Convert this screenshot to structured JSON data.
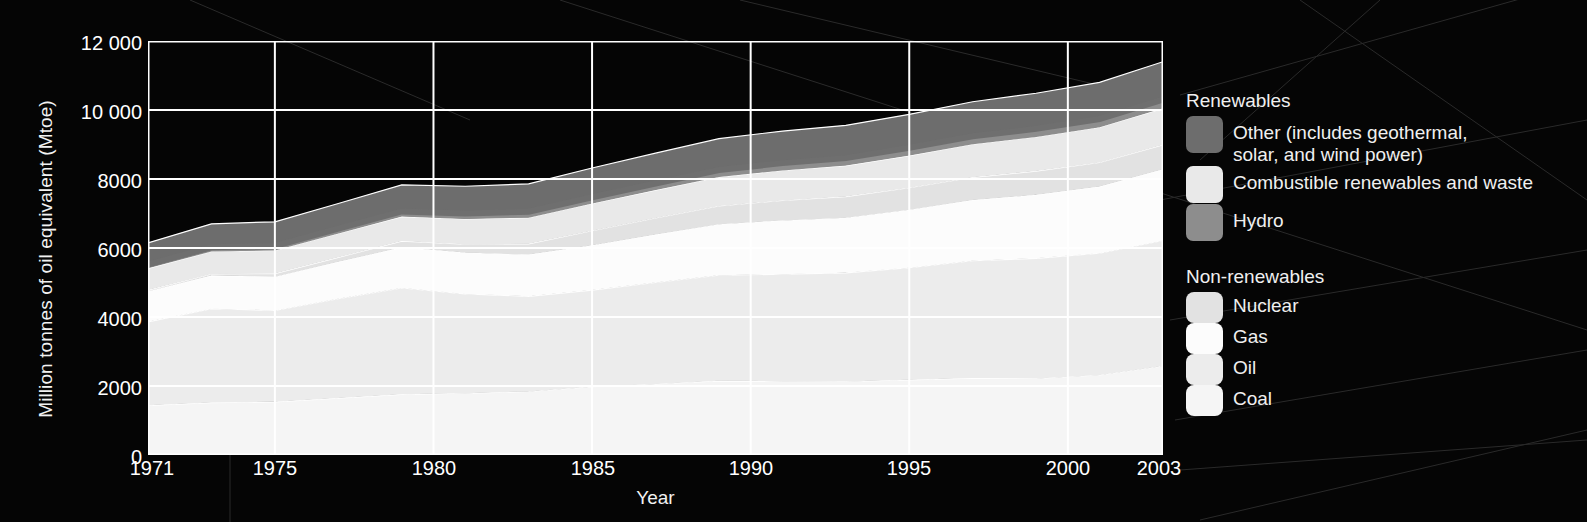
{
  "axes": {
    "y_title": "Million tonnes of oil equivalent (Mtoe)",
    "x_title": "Year",
    "y_ticks": [
      "12 000",
      "10 000",
      "8000",
      "6000",
      "4000",
      "2000",
      "0"
    ],
    "x_ticks": [
      "1971",
      "1975",
      "1980",
      "1985",
      "1990",
      "1995",
      "2000",
      "2003"
    ]
  },
  "legend": {
    "renewables": {
      "title": "Renewables",
      "items": [
        {
          "label": "Other (includes geothermal,\nsolar, and wind power)",
          "color": "#6d6d6d",
          "icon": "legend-swatch"
        },
        {
          "label": "Combustible renewables and waste",
          "color": "#e9e9e9",
          "icon": "legend-swatch"
        },
        {
          "label": "Hydro",
          "color": "#8d8d8d",
          "icon": "legend-swatch"
        }
      ]
    },
    "nonrenewables": {
      "title": "Non-renewables",
      "items": [
        {
          "label": "Nuclear",
          "color": "#e2e2e2",
          "icon": "legend-swatch"
        },
        {
          "label": "Gas",
          "color": "#fcfcfc",
          "icon": "legend-swatch"
        },
        {
          "label": "Oil",
          "color": "#ececec",
          "icon": "legend-swatch"
        },
        {
          "label": "Coal",
          "color": "#f5f5f5",
          "icon": "legend-swatch"
        }
      ]
    }
  },
  "chart_data": {
    "type": "area",
    "title": "",
    "xlabel": "Year",
    "ylabel": "Million tonnes of oil equivalent (Mtoe)",
    "xlim": [
      1971,
      2003
    ],
    "ylim": [
      0,
      12000
    ],
    "ytick_values": [
      0,
      2000,
      4000,
      6000,
      8000,
      10000,
      12000
    ],
    "xtick_values": [
      1971,
      1975,
      1980,
      1985,
      1990,
      1995,
      2000,
      2003
    ],
    "grid": true,
    "legend_position": "right",
    "stacked": true,
    "stack_order_bottom_to_top": [
      "Coal",
      "Oil",
      "Gas",
      "Nuclear",
      "Combustible renewables and waste",
      "Hydro",
      "Other (includes geothermal, solar, and wind power)"
    ],
    "x": [
      1971,
      1973,
      1975,
      1977,
      1979,
      1981,
      1983,
      1985,
      1987,
      1989,
      1991,
      1993,
      1995,
      1997,
      1999,
      2001,
      2003
    ],
    "series": [
      {
        "name": "Coal",
        "color": "#f5f5f5",
        "values": [
          1440,
          1520,
          1540,
          1650,
          1760,
          1790,
          1840,
          1980,
          2060,
          2150,
          2140,
          2130,
          2180,
          2230,
          2220,
          2320,
          2580
        ]
      },
      {
        "name": "Oil",
        "color": "#ececec",
        "values": [
          2420,
          2720,
          2650,
          2880,
          3080,
          2880,
          2760,
          2800,
          2940,
          3060,
          3100,
          3150,
          3250,
          3400,
          3480,
          3530,
          3640
        ]
      },
      {
        "name": "Gas",
        "color": "#fcfcfc",
        "values": [
          890,
          960,
          980,
          1070,
          1180,
          1200,
          1210,
          1300,
          1390,
          1480,
          1560,
          1600,
          1680,
          1760,
          1840,
          1930,
          2060
        ]
      },
      {
        "name": "Nuclear",
        "color": "#e2e2e2",
        "values": [
          30,
          50,
          90,
          130,
          180,
          240,
          310,
          420,
          480,
          530,
          580,
          610,
          640,
          660,
          690,
          700,
          710
        ]
      },
      {
        "name": "Combustible renewables and waste",
        "color": "#e9e9e9",
        "values": [
          630,
          650,
          670,
          690,
          710,
          730,
          760,
          790,
          810,
          840,
          870,
          900,
          930,
          960,
          990,
          1020,
          1060
        ]
      },
      {
        "name": "Hydro",
        "color": "#8d8d8d",
        "values": [
          110,
          120,
          130,
          140,
          150,
          160,
          170,
          180,
          190,
          200,
          210,
          215,
          225,
          230,
          235,
          240,
          250
        ]
      },
      {
        "name": "Other (includes geothermal, solar, and wind power)",
        "color": "#6d6d6d",
        "values": [
          630,
          680,
          700,
          730,
          770,
          790,
          810,
          850,
          880,
          910,
          930,
          950,
          970,
          1000,
          1030,
          1060,
          1100
        ]
      }
    ],
    "totals": [
      6150,
      6700,
      6760,
      7290,
      7830,
      7790,
      7860,
      8320,
      8750,
      9170,
      9390,
      9555,
      9875,
      10240,
      10485,
      10800,
      11400
    ]
  }
}
